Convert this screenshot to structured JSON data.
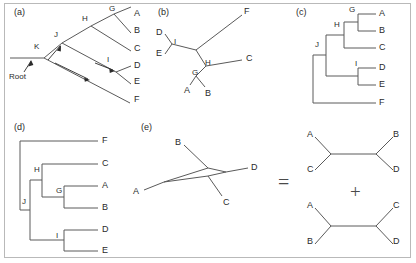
{
  "figure": {
    "caption_free": true,
    "background_color": "#ffffff",
    "line_color": "#5a5a5a",
    "text_color": "#2b2b2b",
    "border_color": "#b9b9b9"
  },
  "panels": {
    "a": {
      "label": "(a)",
      "type": "rooted-slanted-phylogram-with-lineage-arrows",
      "root_annotation": "Root",
      "tips": [
        "A",
        "B",
        "C",
        "D",
        "E",
        "F"
      ],
      "internal_nodes": [
        "G",
        "H",
        "I",
        "J",
        "K"
      ],
      "tip_labels": [
        {
          "name": "A",
          "x": 134,
          "y": 14
        },
        {
          "name": "B",
          "x": 134,
          "y": 31
        },
        {
          "name": "C",
          "x": 134,
          "y": 49
        },
        {
          "name": "D",
          "x": 134,
          "y": 66
        },
        {
          "name": "E",
          "x": 134,
          "y": 82
        },
        {
          "name": "F",
          "x": 134,
          "y": 100
        }
      ],
      "node_labels": [
        {
          "name": "G",
          "x": 109,
          "y": 11
        },
        {
          "name": "H",
          "x": 82,
          "y": 20
        },
        {
          "name": "I",
          "x": 107,
          "y": 62
        },
        {
          "name": "J",
          "x": 53,
          "y": 36
        },
        {
          "name": "K",
          "x": 33,
          "y": 46
        }
      ],
      "root_label": {
        "text": "Root",
        "x": 10,
        "y": 76
      }
    },
    "b": {
      "label": "(b)",
      "type": "unrooted-tree",
      "tips": [
        "A",
        "B",
        "C",
        "D",
        "E",
        "F"
      ],
      "internal_nodes": [
        "G",
        "H",
        "I"
      ],
      "tip_labels": [
        {
          "name": "F",
          "x": 244,
          "y": 12
        },
        {
          "name": "D",
          "x": 162,
          "y": 39
        },
        {
          "name": "E",
          "x": 162,
          "y": 55
        },
        {
          "name": "C",
          "x": 246,
          "y": 59
        },
        {
          "name": "A",
          "x": 188,
          "y": 88
        },
        {
          "name": "B",
          "x": 212,
          "y": 90
        }
      ],
      "node_labels": [
        {
          "name": "I",
          "x": 182,
          "y": 44
        },
        {
          "name": "H",
          "x": 206,
          "y": 69
        },
        {
          "name": "G",
          "x": 193,
          "y": 77
        }
      ]
    },
    "c": {
      "label": "(c)",
      "type": "rooted-rectangular-cladogram",
      "tips": [
        "A",
        "B",
        "C",
        "D",
        "E",
        "F"
      ],
      "internal_nodes": [
        "G",
        "H",
        "I",
        "J"
      ],
      "tip_labels": [
        {
          "name": "A",
          "x": 379,
          "y": 14
        },
        {
          "name": "B",
          "x": 379,
          "y": 31
        },
        {
          "name": "C",
          "x": 379,
          "y": 48
        },
        {
          "name": "D",
          "x": 379,
          "y": 68
        },
        {
          "name": "E",
          "x": 379,
          "y": 85
        },
        {
          "name": "F",
          "x": 379,
          "y": 103
        }
      ],
      "node_labels": [
        {
          "name": "G",
          "x": 349,
          "y": 13
        },
        {
          "name": "H",
          "x": 334,
          "y": 28
        },
        {
          "name": "I",
          "x": 355,
          "y": 66
        },
        {
          "name": "J",
          "x": 314,
          "y": 44
        }
      ]
    },
    "d": {
      "label": "(d)",
      "type": "rooted-rectangular-cladogram",
      "tips": [
        "F",
        "C",
        "A",
        "B",
        "D",
        "E"
      ],
      "internal_nodes": [
        "G",
        "H",
        "I",
        "J"
      ],
      "tip_labels": [
        {
          "name": "F",
          "x": 103,
          "y": 141
        },
        {
          "name": "C",
          "x": 103,
          "y": 164
        },
        {
          "name": "A",
          "x": 103,
          "y": 186
        },
        {
          "name": "B",
          "x": 103,
          "y": 208
        },
        {
          "name": "D",
          "x": 103,
          "y": 230
        },
        {
          "name": "E",
          "x": 103,
          "y": 251
        }
      ],
      "node_labels": [
        {
          "name": "H",
          "x": 37,
          "y": 172
        },
        {
          "name": "G",
          "x": 59,
          "y": 193
        },
        {
          "name": "J",
          "x": 22,
          "y": 200
        },
        {
          "name": "I",
          "x": 58,
          "y": 238
        }
      ]
    },
    "e": {
      "label": "(e)",
      "type": "ambiguous-network-equals-two-trees",
      "network": {
        "tips": [
          "A",
          "B",
          "C",
          "D"
        ],
        "tip_labels": [
          {
            "name": "B",
            "x": 177,
            "y": 155
          },
          {
            "name": "D",
            "x": 243,
            "y": 175
          },
          {
            "name": "A",
            "x": 155,
            "y": 186
          },
          {
            "name": "C",
            "x": 224,
            "y": 202
          }
        ]
      },
      "equals_symbol": "=",
      "plus_symbol": "+",
      "tree_top": {
        "description": "unrooted quartet A,C | B,D",
        "tip_labels": [
          {
            "name": "A",
            "x": 310,
            "y": 136
          },
          {
            "name": "B",
            "x": 393,
            "y": 136
          },
          {
            "name": "C",
            "x": 310,
            "y": 168
          },
          {
            "name": "D",
            "x": 393,
            "y": 168
          }
        ]
      },
      "tree_bottom": {
        "description": "unrooted quartet A,B | C,D",
        "tip_labels": [
          {
            "name": "A",
            "x": 310,
            "y": 198
          },
          {
            "name": "C",
            "x": 393,
            "y": 198
          },
          {
            "name": "B",
            "x": 310,
            "y": 233
          },
          {
            "name": "D",
            "x": 393,
            "y": 233
          }
        ]
      }
    }
  }
}
